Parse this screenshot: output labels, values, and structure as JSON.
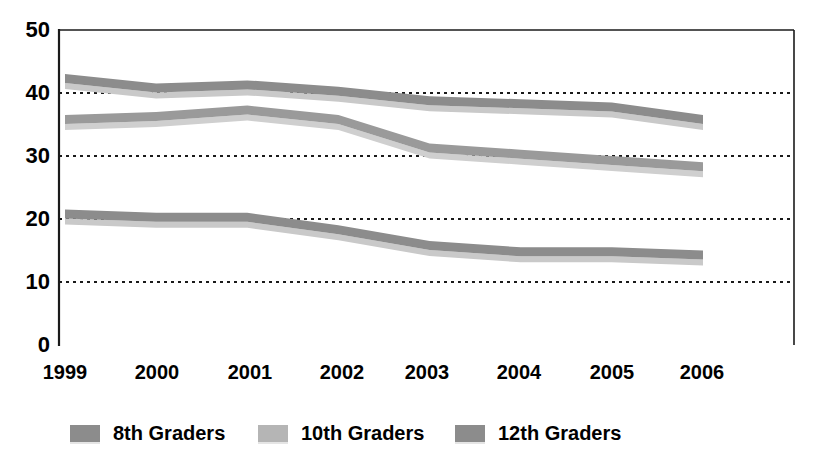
{
  "chart_data": {
    "type": "area",
    "title": "",
    "subtitle": "",
    "xlabel": "",
    "ylabel": "",
    "x": [
      "1999",
      "2000",
      "2001",
      "2002",
      "2003",
      "2004",
      "2005",
      "2006"
    ],
    "categories": [
      "1999",
      "2000",
      "2001",
      "2002",
      "2003",
      "2004",
      "2005",
      "2006"
    ],
    "xlim": [
      "1999",
      "2006"
    ],
    "ylim": [
      0,
      50
    ],
    "y_ticks": [
      0,
      10,
      20,
      30,
      40,
      50
    ],
    "y_tick_labels": [
      "0",
      "10",
      "20",
      "30",
      "40",
      "50"
    ],
    "grid": "horizontal-dotted",
    "legend_position": "bottom",
    "series": [
      {
        "name": "8th Graders",
        "color": "#8c8c8c",
        "shadow_color": "#c9c9c9",
        "values": [
          21.5,
          21.0,
          21.0,
          19.0,
          16.5,
          15.5,
          15.5,
          15.0
        ]
      },
      {
        "name": "10th Graders",
        "color": "#9a9a9a",
        "shadow_color": "#cfcfcf",
        "values": [
          36.5,
          37.0,
          38.0,
          36.5,
          32.0,
          31.0,
          30.0,
          29.0
        ]
      },
      {
        "name": "12th Graders",
        "color": "#8c8c8c",
        "shadow_color": "#c9c9c9",
        "values": [
          43.0,
          41.5,
          42.0,
          41.0,
          39.5,
          39.0,
          38.5,
          36.5
        ]
      }
    ],
    "series_draw_order": [
      "12th Graders",
      "10th Graders",
      "8th Graders"
    ]
  },
  "axes": {
    "y_labels": [
      "50",
      "40",
      "30",
      "20",
      "10",
      "0"
    ],
    "x_labels": [
      "1999",
      "2000",
      "2001",
      "2002",
      "2003",
      "2004",
      "2005",
      "2006"
    ]
  },
  "legend": {
    "items": [
      {
        "label": "8th Graders",
        "swatch_color": "#8c8c8c"
      },
      {
        "label": "10th Graders",
        "swatch_color": "#b5b5b5"
      },
      {
        "label": "12th Graders",
        "swatch_color": "#8c8c8c"
      }
    ]
  },
  "colors": {
    "axis": "#1a1a1a",
    "gridline": "#1a1a1a",
    "plot_background": "#ffffff",
    "text": "#000000"
  }
}
